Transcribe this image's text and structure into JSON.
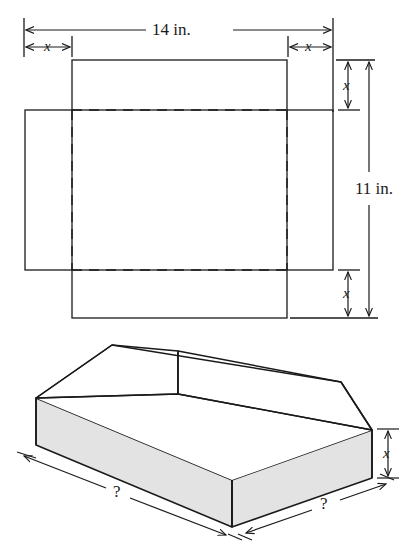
{
  "figure": {
    "stroke_color": "#1a1a1a",
    "face_fill_color": "#e3e3e3",
    "background_color": "#ffffff"
  },
  "flat_sheet": {
    "name": "flat-pattern-diagram",
    "width_label": "14 in.",
    "height_label": "11 in.",
    "corner_cut_label_top_left": "x",
    "corner_cut_label_top_right": "x",
    "corner_cut_label_right_top": "x",
    "corner_cut_label_right_bottom": "x",
    "solid_rect": {
      "desc": "inner solid rectangle (box base footprint projected)",
      "x": 72,
      "y": 60,
      "w": 215,
      "h": 258
    },
    "outer_rect": {
      "desc": "outer solid rectangle (sheet outline offset)",
      "x": 25,
      "y": 110,
      "w": 308,
      "h": 160
    },
    "dashed_rect": {
      "desc": "dashed fold lines rectangle",
      "x": 72,
      "y": 110,
      "w": 215,
      "h": 160
    }
  },
  "box_3d": {
    "name": "open-box-diagram",
    "height_label": "x",
    "length_label_left": "?",
    "length_label_right": "?"
  },
  "labels": {
    "width": "14 in.",
    "height": "11 in.",
    "x": "x",
    "question": "?"
  }
}
